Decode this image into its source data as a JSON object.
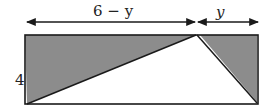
{
  "diagram": {
    "type": "geometry-figure",
    "labels": {
      "top_left_dimension": "6 − y",
      "top_right_dimension": "y",
      "left_side_height": "4"
    },
    "colors": {
      "shaded": "#8c8c8c",
      "stroke": "#1a1a1a",
      "background": "#ffffff"
    },
    "shapes": {
      "rectangle": "outer rectangle with width 6 and height 4",
      "shaded_left_triangle": "triangle from top-left corner to top apex to bottom-left corner",
      "shaded_right_triangle": "triangle from top apex to top-right corner to bottom-right corner",
      "unshaded_triangle": "white triangle with base along bottom edge and apex on top edge"
    }
  }
}
